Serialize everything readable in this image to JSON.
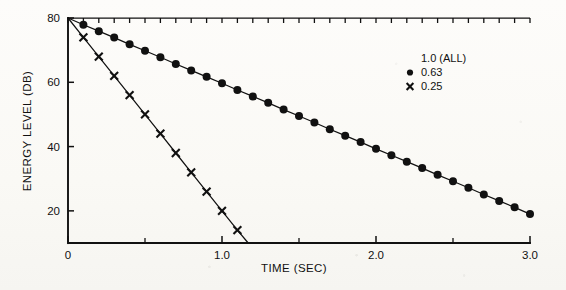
{
  "chart_data": {
    "type": "line",
    "title": "",
    "xlabel": "TIME (SEC)",
    "ylabel": "ENERGY LEVEL (DB)",
    "xlim": [
      0,
      3.0
    ],
    "ylim": [
      10,
      80
    ],
    "grid": false,
    "legend_position": "top-right",
    "x_tick_labels": [
      "0",
      "1.0",
      "2.0",
      "3.0"
    ],
    "x_tick_values": [
      0,
      1.0,
      2.0,
      3.0
    ],
    "x_minor_tick_values": [
      0.5,
      1.5,
      2.5
    ],
    "y_tick_labels": [
      "80",
      "60",
      "40",
      "20"
    ],
    "y_tick_values": [
      80,
      60,
      40,
      20
    ],
    "series": [
      {
        "name": "1.0 (ALL)",
        "marker": "none",
        "x": [
          0,
          3.0
        ],
        "values": [
          80,
          80
        ]
      },
      {
        "name": "0.63",
        "marker": "filled-circle",
        "x": [
          0,
          0.1,
          0.2,
          0.3,
          0.4,
          0.5,
          0.6,
          0.7,
          0.8,
          0.9,
          1.0,
          1.1,
          1.2,
          1.3,
          1.4,
          1.5,
          1.6,
          1.7,
          1.8,
          1.9,
          2.0,
          2.1,
          2.2,
          2.3,
          2.4,
          2.5,
          2.6,
          2.7,
          2.8,
          2.9,
          3.0
        ],
        "values": [
          80.0,
          77.9,
          75.9,
          73.9,
          71.8,
          69.8,
          67.8,
          65.7,
          63.7,
          61.7,
          59.7,
          57.6,
          55.6,
          53.6,
          51.5,
          49.5,
          47.5,
          45.4,
          43.4,
          41.4,
          39.3,
          37.3,
          35.3,
          33.3,
          31.2,
          29.2,
          27.2,
          25.1,
          23.1,
          21.1,
          19.0
        ]
      },
      {
        "name": "0.25",
        "marker": "cross",
        "x": [
          0,
          0.1,
          0.2,
          0.3,
          0.4,
          0.5,
          0.6,
          0.7,
          0.8,
          0.9,
          1.0,
          1.1,
          1.17
        ],
        "values": [
          80.0,
          74.0,
          68.0,
          62.0,
          56.0,
          50.0,
          44.0,
          38.0,
          32.0,
          26.0,
          20.0,
          14.0,
          10.0
        ]
      }
    ]
  },
  "legend": {
    "entries": [
      {
        "label": "1.0 (ALL)",
        "marker": "none"
      },
      {
        "label": "0.63",
        "marker": "filled-circle"
      },
      {
        "label": "0.25",
        "marker": "cross"
      }
    ]
  }
}
